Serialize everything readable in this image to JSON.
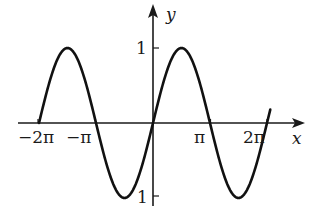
{
  "chart_data": {
    "type": "line",
    "title": "",
    "function": "y = sin(x)",
    "xlabel": "x",
    "ylabel": "y",
    "x_domain": [
      -6.2832,
      6.2832
    ],
    "xlim": [
      -7.0,
      8.6
    ],
    "ylim": [
      -1.2,
      1.3
    ],
    "grid": false,
    "legend": null,
    "x_ticks": [
      {
        "value": -6.2832,
        "label": "−2π"
      },
      {
        "value": -3.1416,
        "label": "−π"
      },
      {
        "value": 3.1416,
        "label": "π"
      },
      {
        "value": 6.2832,
        "label": "2π"
      }
    ],
    "y_ticks": [
      {
        "value": 1,
        "label": "1"
      },
      {
        "value": -1,
        "label": "−1"
      }
    ],
    "series": [
      {
        "name": "sin(x)",
        "x": [
          -6.2832,
          -4.7124,
          -3.1416,
          -1.5708,
          0,
          1.5708,
          3.1416,
          4.7124,
          6.2832
        ],
        "y": [
          0,
          1,
          0,
          -1,
          0,
          1,
          0,
          -1,
          0
        ]
      }
    ]
  },
  "labels": {
    "x_axis": "x",
    "y_axis": "y",
    "tick_neg_2pi": "−2π",
    "tick_neg_pi": "−π",
    "tick_pi": "π",
    "tick_2pi": "2π",
    "tick_y_1": "1",
    "tick_y_neg1": "1"
  }
}
